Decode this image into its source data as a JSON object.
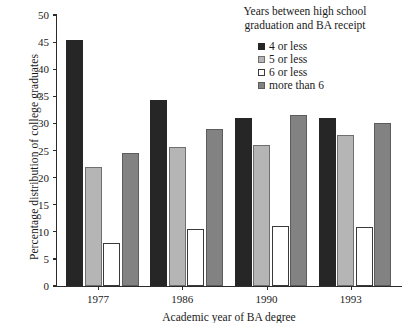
{
  "chart_data": {
    "type": "bar",
    "title": "",
    "xlabel": "Academic year of BA degree",
    "ylabel": "Percentage distribution of college graduates",
    "categories": [
      "1977",
      "1986",
      "1990",
      "1993"
    ],
    "ylim": [
      0,
      50
    ],
    "ytick_step": 5,
    "yticks": [
      "50",
      "45",
      "40",
      "35",
      "30",
      "25",
      "20",
      "15",
      "10",
      "5",
      "0"
    ],
    "grid": false,
    "legend_position": "top-right",
    "legend_title": "Years between high school graduation and BA receipt",
    "legend_title_line1": "Years between high school",
    "legend_title_line2": "graduation and BA receipt",
    "series": [
      {
        "name": "4 or less",
        "color": "#262626",
        "border": "#262626",
        "values": [
          45.3,
          34.4,
          31.0,
          31.0
        ]
      },
      {
        "name": "5 or less",
        "color": "#b5b5b5",
        "border": "#6f6f6f",
        "values": [
          21.9,
          25.6,
          26.0,
          27.8
        ]
      },
      {
        "name": "6 or less",
        "color": "#ffffff",
        "border": "#3a3a3a",
        "values": [
          7.9,
          10.5,
          11.0,
          10.9
        ]
      },
      {
        "name": "more than 6",
        "color": "#828282",
        "border": "#5c5c5c",
        "values": [
          24.6,
          29.0,
          31.5,
          30.0
        ]
      }
    ]
  },
  "axis": {
    "y_title": "Percentage distribution of college graduates",
    "x_title": "Academic year of BA degree"
  }
}
